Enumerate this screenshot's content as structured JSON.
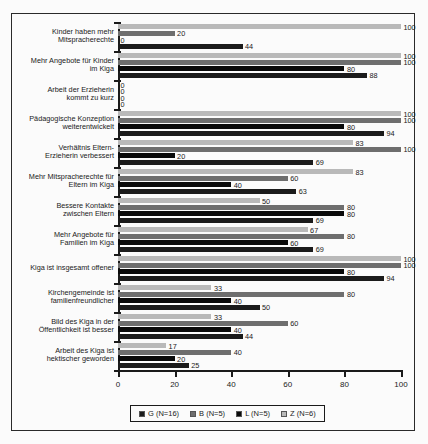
{
  "chart_data": {
    "type": "bar",
    "orientation": "horizontal",
    "title": "",
    "xlabel": "",
    "ylabel": "",
    "xlim": [
      0,
      100
    ],
    "xticks": [
      0,
      20,
      40,
      60,
      80,
      100
    ],
    "grid": false,
    "legend_position": "bottom",
    "categories": [
      "Kinder haben mehr Mitspracherechte",
      "Mehr Angebote für Kinder im Kiga",
      "Arbeit der Erzieherin kommt zu kurz",
      "Pädagogische Konzeption weiterentwickelt",
      "Verhältnis Eltern- Erzieherin verbessert",
      "Mehr Mitspracherechte für Eltern im Kiga",
      "Bessere Kontakte zwischen Eltern",
      "Mehr Angebote für Familien im Kiga",
      "Kiga ist insgesamt offener",
      "Kirchengemeinde ist familienfreundlicher",
      "Bild des Kiga in der Öffentlichkeit ist besser",
      "Arbeit des Kiga ist hektischer geworden"
    ],
    "category_lines": [
      [
        "Kinder haben mehr",
        "Mitspracherechte"
      ],
      [
        "Mehr Angebote für Kinder",
        "im Kiga"
      ],
      [
        "Arbeit der Erzieherin",
        "kommt zu kurz"
      ],
      [
        "Pädagogische Konzeption",
        "weiterentwickelt"
      ],
      [
        "Verhältnis Eltern-",
        "Erzieherin verbessert"
      ],
      [
        "Mehr Mitspracherechte für",
        "Eltern im Kiga"
      ],
      [
        "Bessere Kontakte",
        "zwischen Eltern"
      ],
      [
        "Mehr Angebote für",
        "Familien im Kiga"
      ],
      [
        "Kiga ist insgesamt offener"
      ],
      [
        "Kirchengemeinde ist",
        "familienfreundlicher"
      ],
      [
        "Bild des Kiga in der",
        "Öffentlichkeit ist besser"
      ],
      [
        "Arbeit des Kiga ist",
        "hektischer geworden"
      ]
    ],
    "series": [
      {
        "name": "G (N=16)",
        "key": "G",
        "color": "#1b1b1b",
        "values": [
          44,
          88,
          0,
          94,
          69,
          63,
          69,
          69,
          94,
          50,
          44,
          25
        ]
      },
      {
        "name": "B (N=5)",
        "key": "B",
        "color": "#6e6e6e",
        "values": [
          20,
          100,
          0,
          100,
          100,
          60,
          80,
          80,
          100,
          80,
          60,
          40
        ]
      },
      {
        "name": "L (N=5)",
        "key": "L",
        "color": "#0a0a0a",
        "values": [
          0,
          80,
          0,
          80,
          20,
          40,
          80,
          60,
          80,
          40,
          40,
          20
        ]
      },
      {
        "name": "Z (N=6)",
        "key": "Z",
        "color": "#b9b9b9",
        "values": [
          100,
          100,
          0,
          100,
          83,
          83,
          50,
          67,
          100,
          33,
          33,
          17
        ]
      }
    ]
  },
  "legend": {
    "entries": [
      {
        "label": "G (N=16)",
        "key": "G"
      },
      {
        "label": "B (N=5)",
        "key": "B"
      },
      {
        "label": "L (N=5)",
        "key": "L"
      },
      {
        "label": "Z (N=6)",
        "key": "Z"
      }
    ]
  }
}
